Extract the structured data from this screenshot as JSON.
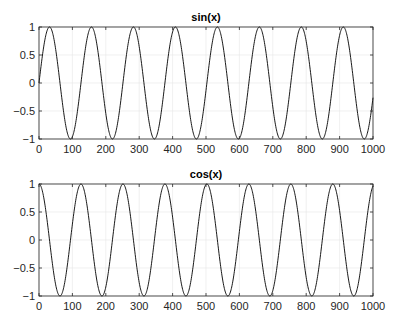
{
  "figure": {
    "background": "#ffffff",
    "axis_color": "#262626",
    "grid_color": "#e6e6e6",
    "line_color": "#000000"
  },
  "chart_data": [
    {
      "type": "line",
      "title": "sin(x)",
      "xlabel": "",
      "ylabel": "",
      "xlim": [
        0,
        1000
      ],
      "ylim": [
        -1,
        1
      ],
      "grid": true,
      "xticks": [
        0,
        100,
        200,
        300,
        400,
        500,
        600,
        700,
        800,
        900,
        1000
      ],
      "xtick_labels": [
        "0",
        "100",
        "200",
        "300",
        "400",
        "500",
        "600",
        "700",
        "800",
        "900",
        "1000"
      ],
      "yticks": [
        -1,
        -0.5,
        0,
        0.5,
        1
      ],
      "ytick_labels": [
        "−1",
        "−0.5",
        "0",
        "0.5",
        "1"
      ],
      "series": [
        {
          "name": "sin(x)",
          "function": "sin",
          "frequency": 0.05,
          "x": [
            0,
            31,
            63,
            94,
            126,
            157,
            188,
            220,
            251,
            283,
            314,
            346,
            377,
            408,
            440,
            471,
            503,
            534,
            565,
            597,
            628,
            660,
            691,
            723,
            754,
            785,
            817,
            848,
            880,
            911,
            942,
            974,
            1000
          ],
          "values": [
            0,
            1,
            0,
            -1,
            0,
            1,
            0,
            -1,
            0,
            1,
            0,
            -1,
            0,
            1,
            0,
            -1,
            0,
            1,
            0,
            -1,
            0,
            1,
            0,
            -1,
            0,
            1,
            0,
            -1,
            0,
            1,
            0,
            -1,
            -0.26
          ]
        }
      ]
    },
    {
      "type": "line",
      "title": "cos(x)",
      "xlabel": "",
      "ylabel": "",
      "xlim": [
        0,
        1000
      ],
      "ylim": [
        -1,
        1
      ],
      "grid": true,
      "xticks": [
        0,
        100,
        200,
        300,
        400,
        500,
        600,
        700,
        800,
        900,
        1000
      ],
      "xtick_labels": [
        "0",
        "100",
        "200",
        "300",
        "400",
        "500",
        "600",
        "700",
        "800",
        "900",
        "1000"
      ],
      "yticks": [
        -1,
        -0.5,
        0,
        0.5,
        1
      ],
      "ytick_labels": [
        "−1",
        "−0.5",
        "0",
        "0.5",
        "1"
      ],
      "series": [
        {
          "name": "cos(x)",
          "function": "cos",
          "frequency": 0.05,
          "x": [
            0,
            31,
            63,
            94,
            126,
            157,
            188,
            220,
            251,
            283,
            314,
            346,
            377,
            408,
            440,
            471,
            503,
            534,
            565,
            597,
            628,
            660,
            691,
            723,
            754,
            785,
            817,
            848,
            880,
            911,
            942,
            974,
            1000
          ],
          "values": [
            1,
            0,
            -1,
            0,
            1,
            0,
            -1,
            0,
            1,
            0,
            -1,
            0,
            1,
            0,
            -1,
            0,
            1,
            0,
            -1,
            0,
            1,
            0,
            -1,
            0,
            1,
            0,
            -1,
            0,
            1,
            0,
            -1,
            0,
            0.97
          ]
        }
      ]
    }
  ]
}
